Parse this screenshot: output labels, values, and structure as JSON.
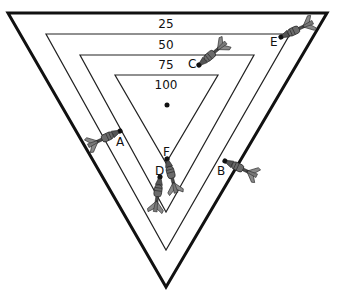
{
  "diagram": {
    "rings": [
      {
        "score": "25",
        "label_x": 166,
        "label_y": 28
      },
      {
        "score": "50",
        "label_x": 166,
        "label_y": 49
      },
      {
        "score": "75",
        "label_x": 166,
        "label_y": 69
      },
      {
        "score": "100",
        "label_x": 166,
        "label_y": 89
      }
    ],
    "center_dot": {
      "x": 167,
      "y": 105
    },
    "darts": [
      {
        "label": "A",
        "tip_x": 120,
        "tip_y": 131,
        "angle": 200
      },
      {
        "label": "B",
        "tip_x": 225,
        "tip_y": 161,
        "angle": 25
      },
      {
        "label": "C",
        "tip_x": 199,
        "tip_y": 65,
        "angle": -40
      },
      {
        "label": "D",
        "tip_x": 160,
        "tip_y": 177,
        "angle": 98
      },
      {
        "label": "E",
        "tip_x": 281,
        "tip_y": 37,
        "angle": -25
      },
      {
        "label": "F",
        "tip_x": 167,
        "tip_y": 159,
        "angle": 75
      }
    ],
    "colors": {
      "line": "#111111",
      "dart_body": "#6b6b6b",
      "dart_flight": "#8a8a8a",
      "dart_dark": "#333333"
    }
  }
}
